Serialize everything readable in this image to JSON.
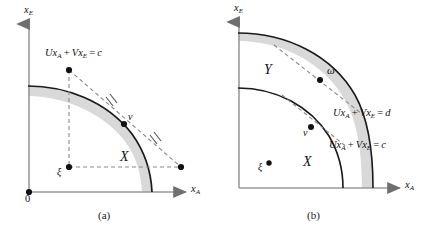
{
  "figure": {
    "type": "two-panel-diagram",
    "background": "#ffffff",
    "curve_color": "#1a1a1a",
    "band_color": "#d9d9d9",
    "dashed_color": "#8a8a8a",
    "axis_color": "#9a9a9a",
    "text_color": "#111111"
  },
  "panel_a": {
    "caption": "(a)",
    "axis_x_label": "x",
    "axis_x_sub": "A",
    "axis_y_label": "x",
    "axis_y_sub": "E",
    "origin_label": "0",
    "budget_line_label": {
      "u": "U",
      "xa": "x",
      "xa_sub": "A",
      "plus": "+",
      "v": "V",
      "xe": "x",
      "xe_sub": "E",
      "equals": "=",
      "value": "c",
      "full": "Ux_A + Vx_E = c"
    },
    "points": [
      {
        "name": "v",
        "label": "v",
        "kind": "tangency-point"
      },
      {
        "name": "xi",
        "label": "ξ",
        "kind": "endowment-point"
      },
      {
        "name": "intercept-upper",
        "label": "",
        "kind": "axis-intercept-dot"
      },
      {
        "name": "intercept-right",
        "label": "",
        "kind": "axis-intercept-dot"
      },
      {
        "name": "origin",
        "label": "0",
        "kind": "origin-dot"
      }
    ],
    "region_label": "X",
    "hash_marks": 2
  },
  "panel_b": {
    "caption": "(b)",
    "axis_x_label": "x",
    "axis_x_sub": "A",
    "axis_y_label": "x",
    "axis_y_sub": "E",
    "line_label_outer": {
      "u": "U",
      "xa": "x",
      "xa_sub": "A",
      "plus": "+",
      "v": "V",
      "xe": "x",
      "xe_sub": "E",
      "equals": "=",
      "value": "d",
      "full": "Ux_A + Vx_E = d"
    },
    "line_label_inner": {
      "u": "U",
      "xa": "x",
      "xa_sub": "A",
      "plus": "+",
      "v": "V",
      "xe": "x",
      "xe_sub": "E",
      "equals": "=",
      "value": "c",
      "full": "Ux_A + Vx_E = c"
    },
    "points": [
      {
        "name": "omega",
        "label": "ω",
        "kind": "tangency-point-outer"
      },
      {
        "name": "v",
        "label": "v",
        "kind": "tangency-point-inner"
      },
      {
        "name": "xi",
        "label": "ξ",
        "kind": "endowment-point"
      }
    ],
    "region_outer_label": "Y",
    "region_inner_label": "X"
  }
}
